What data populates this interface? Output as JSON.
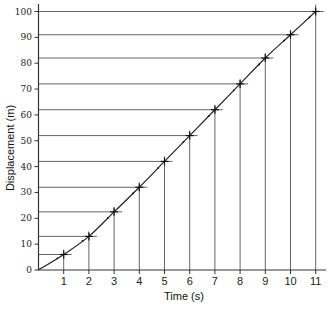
{
  "chart_data": {
    "type": "line",
    "title": "",
    "xlabel": "Time (s)",
    "ylabel": "Displacement (m)",
    "x": [
      0,
      1,
      2,
      3,
      4,
      5,
      6,
      7,
      8,
      9,
      10,
      11
    ],
    "series": [
      {
        "name": "Displacement",
        "values": [
          0,
          6,
          13,
          22.5,
          32,
          42,
          52,
          62,
          72,
          82,
          91,
          100
        ]
      }
    ],
    "x_ticks": [
      "1",
      "2",
      "3",
      "4",
      "5",
      "6",
      "7",
      "8",
      "9",
      "10",
      "11"
    ],
    "y_ticks": [
      "0",
      "10",
      "20",
      "30",
      "40",
      "50",
      "60",
      "70",
      "80",
      "90",
      "100"
    ],
    "xlim": [
      0,
      11.4
    ],
    "ylim": [
      0,
      100
    ],
    "grid": false,
    "legend": null,
    "annotations": "Drop lines from each data point to both axes; data points marked with crosses"
  }
}
